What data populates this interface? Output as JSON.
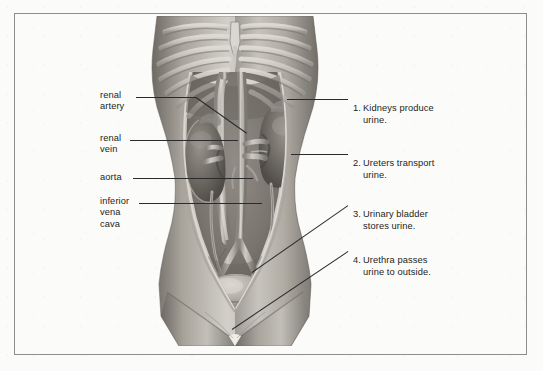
{
  "figure": {
    "title_visible": false,
    "background_color": "#fbfbfa",
    "frame_color": "#8d8d8d",
    "text_color": "#231f20",
    "leader_color": "#2b2b2b"
  },
  "left_labels": [
    {
      "id": "renal-artery",
      "text": "renal\nartery",
      "x": 100,
      "y": 93
    },
    {
      "id": "renal-vein",
      "text": "renal\nvein",
      "x": 100,
      "y": 136
    },
    {
      "id": "aorta",
      "text": "aorta",
      "x": 100,
      "y": 174
    },
    {
      "id": "inferior-vena-cava",
      "text": "inferior\nvena\ncava",
      "x": 100,
      "y": 199
    }
  ],
  "right_labels": [
    {
      "id": "kidneys",
      "number": "1.",
      "text": "Kidneys produce\nurine.",
      "x": 353,
      "y": 95
    },
    {
      "id": "ureters",
      "number": "2.",
      "text": "Ureters transport\nurine.",
      "x": 353,
      "y": 150
    },
    {
      "id": "urinary-bladder",
      "number": "3.",
      "text": "Urinary bladder\nstores urine.",
      "x": 353,
      "y": 201
    },
    {
      "id": "urethra",
      "number": "4.",
      "text": "Urethra passes\nurine to outside.",
      "x": 353,
      "y": 247
    }
  ],
  "leaders": [
    {
      "id": "leader-renal-artery",
      "x1": 136,
      "y1": 97,
      "x2": 196,
      "y2": 97
    },
    {
      "id": "leader-renal-artery-hook",
      "x1": 196,
      "y1": 97,
      "x2": 247,
      "y2": 133
    },
    {
      "id": "leader-renal-vein",
      "x1": 130,
      "y1": 140,
      "x2": 238,
      "y2": 140
    },
    {
      "id": "leader-aorta",
      "x1": 133,
      "y1": 178,
      "x2": 253,
      "y2": 178
    },
    {
      "id": "leader-inferior-vena-cava",
      "x1": 139,
      "y1": 203,
      "x2": 262,
      "y2": 203
    },
    {
      "id": "leader-kidneys",
      "x1": 348,
      "y1": 99,
      "x2": 287,
      "y2": 99
    },
    {
      "id": "leader-ureters",
      "x1": 348,
      "y1": 154,
      "x2": 291,
      "y2": 154
    },
    {
      "id": "leader-bladder",
      "x1": 348,
      "y1": 205,
      "x2": 252,
      "y2": 272
    },
    {
      "id": "leader-urethra",
      "x1": 348,
      "y1": 251,
      "x2": 232,
      "y2": 329
    }
  ],
  "illustration": {
    "name": "anterior-abdominal-urinary-system",
    "description": "Grayscale anatomical drawing of a human torso viewed from the front with the abdominal wall opened to reveal the ribcage, kidneys, aorta, inferior vena cava, ureters and urinary bladder.",
    "parts": [
      "ribcage",
      "xiphoid-process",
      "left-kidney",
      "right-kidney",
      "aorta",
      "inferior-vena-cava",
      "renal-artery",
      "renal-vein",
      "left-ureter",
      "right-ureter",
      "urinary-bladder",
      "urethra",
      "abdominal-cavity",
      "pelvis",
      "thighs"
    ],
    "palette": {
      "skin_light": "#d8d5cf",
      "skin_mid": "#b3afa7",
      "skin_dark": "#8e8a83",
      "cavity": "#7c7871",
      "cavity_dark": "#615e58",
      "bone": "#cfccc5",
      "organ": "#6f6b65",
      "organ_light": "#9a958e",
      "vessel": "#b8b4ad",
      "bladder": "#bab6ae"
    }
  }
}
